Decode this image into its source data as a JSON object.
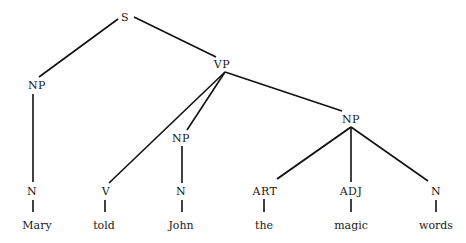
{
  "tree": {
    "nodes": [
      {
        "id": "S",
        "label": "S",
        "x": 125,
        "y": 17
      },
      {
        "id": "NP1",
        "label": "NP",
        "x": 37,
        "y": 85
      },
      {
        "id": "VP",
        "label": "VP",
        "x": 222,
        "y": 64
      },
      {
        "id": "N1",
        "label": "N",
        "x": 32,
        "y": 191
      },
      {
        "id": "V",
        "label": "V",
        "x": 106,
        "y": 191
      },
      {
        "id": "NP2",
        "label": "NP",
        "x": 181,
        "y": 138
      },
      {
        "id": "N2",
        "label": "N",
        "x": 181,
        "y": 191
      },
      {
        "id": "NP3",
        "label": "NP",
        "x": 351,
        "y": 119
      },
      {
        "id": "ART",
        "label": "ART",
        "x": 265,
        "y": 191
      },
      {
        "id": "ADJ",
        "label": "ADJ",
        "x": 351,
        "y": 191
      },
      {
        "id": "N3",
        "label": "N",
        "x": 436,
        "y": 191
      }
    ],
    "words": [
      {
        "label": "Mary",
        "x": 37,
        "y": 225
      },
      {
        "label": "told",
        "x": 104,
        "y": 225
      },
      {
        "label": "John",
        "x": 181,
        "y": 225
      },
      {
        "label": "the",
        "x": 264,
        "y": 225
      },
      {
        "label": "magic",
        "x": 351,
        "y": 225
      },
      {
        "label": "words",
        "x": 436,
        "y": 225
      }
    ],
    "edges": [
      [
        "S",
        "NP1"
      ],
      [
        "S",
        "VP"
      ],
      [
        "NP1",
        "N1"
      ],
      [
        "VP",
        "V"
      ],
      [
        "VP",
        "NP2"
      ],
      [
        "VP",
        "NP3"
      ],
      [
        "NP2",
        "N2"
      ],
      [
        "NP3",
        "ART"
      ],
      [
        "NP3",
        "ADJ"
      ],
      [
        "NP3",
        "N3"
      ]
    ]
  }
}
